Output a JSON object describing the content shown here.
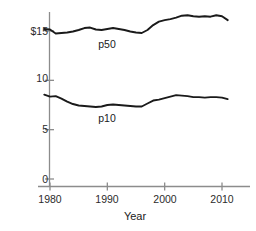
{
  "chart_data": {
    "type": "line",
    "title": "",
    "subtitle": "",
    "xlabel": "Year",
    "ylabel": "",
    "xlim": [
      1978.4,
      2011.6
    ],
    "ylim": [
      0,
      17.6
    ],
    "xticks": [
      1980,
      1990,
      2000,
      2010
    ],
    "xticklabels": [
      "1980",
      "1990",
      "2000",
      "2010"
    ],
    "yticks": [
      0,
      5,
      10,
      15
    ],
    "yticklabels": [
      "0",
      "5",
      "10",
      "$15"
    ],
    "grid": false,
    "legend": "inline annotations",
    "axis_color": "#808080",
    "line_color": "#1a1a1a",
    "annotations": [
      {
        "text": "p50",
        "x": 1990.0,
        "y": 13.6
      },
      {
        "text": "p10",
        "x": 1990.0,
        "y": 6.1
      }
    ],
    "x": [
      1979,
      1980,
      1981,
      1982,
      1983,
      1984,
      1985,
      1986,
      1987,
      1988,
      1989,
      1990,
      1991,
      1992,
      1993,
      1994,
      1995,
      1996,
      1997,
      1998,
      1999,
      2000,
      2001,
      2002,
      2003,
      2004,
      2005,
      2006,
      2007,
      2008,
      2009,
      2010,
      2011
    ],
    "series": [
      {
        "name": "p50",
        "values": [
          15.2,
          15.15,
          14.75,
          14.8,
          14.85,
          14.95,
          15.1,
          15.3,
          15.35,
          15.15,
          15.1,
          15.2,
          15.3,
          15.2,
          15.1,
          14.95,
          14.85,
          14.8,
          15.1,
          15.6,
          15.95,
          16.1,
          16.2,
          16.35,
          16.55,
          16.6,
          16.5,
          16.45,
          16.5,
          16.45,
          16.6,
          16.5,
          16.1
        ]
      },
      {
        "name": "p10",
        "values": [
          8.55,
          8.35,
          8.4,
          8.15,
          7.85,
          7.6,
          7.45,
          7.4,
          7.35,
          7.3,
          7.35,
          7.5,
          7.55,
          7.5,
          7.45,
          7.4,
          7.35,
          7.35,
          7.65,
          7.95,
          8.05,
          8.2,
          8.35,
          8.5,
          8.45,
          8.4,
          8.3,
          8.3,
          8.25,
          8.3,
          8.3,
          8.25,
          8.1
        ]
      }
    ]
  },
  "axis": {
    "yticklabels": [
      "$15",
      "10",
      "5",
      "0"
    ],
    "xticklabels": [
      "1980",
      "1990",
      "2000",
      "2010"
    ],
    "xtitle": "Year"
  },
  "labels": {
    "p50": "p50",
    "p10": "p10"
  }
}
